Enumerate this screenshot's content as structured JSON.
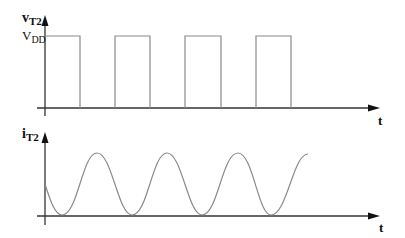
{
  "diagram": {
    "top_plot": {
      "y_label": "v",
      "y_label_sub": "T2",
      "level_label": "V",
      "level_label_sub": "DD",
      "x_label": "t",
      "waveform": "square",
      "pulses": [
        {
          "start": 46,
          "end": 80
        },
        {
          "start": 115,
          "end": 150
        },
        {
          "start": 185,
          "end": 221
        },
        {
          "start": 256,
          "end": 291
        }
      ]
    },
    "bottom_plot": {
      "y_label": "i",
      "y_label_sub": "T2",
      "x_label": "t",
      "waveform": "raised-sinusoid"
    },
    "colors": {
      "axis": "#333333",
      "trace": "#8a8a8a",
      "text": "#111111"
    }
  }
}
